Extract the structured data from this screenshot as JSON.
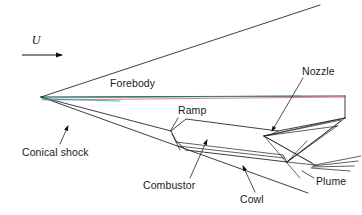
{
  "figure": {
    "type": "technical-line-diagram",
    "background_color": "#ffffff",
    "width": 362,
    "height": 215
  },
  "labels": {
    "freestream_velocity": "U",
    "forebody": "Forebody",
    "conical_shock": "Conical shock",
    "ramp": "Ramp",
    "combustor": "Combustor",
    "cowl": "Cowl",
    "nozzle": "Nozzle",
    "plume": "Plume"
  },
  "label_positions": {
    "freestream_velocity": {
      "x": 35,
      "y": 42
    },
    "forebody": {
      "x": 110,
      "y": 87
    },
    "conical_shock": {
      "x": 22,
      "y": 152
    },
    "ramp": {
      "x": 176,
      "y": 113
    },
    "combustor": {
      "x": 143,
      "y": 186
    },
    "cowl": {
      "x": 240,
      "y": 199
    },
    "nozzle": {
      "x": 302,
      "y": 71
    },
    "plume": {
      "x": 318,
      "y": 181
    }
  },
  "colors": {
    "line_ink": "#1c1c24",
    "leader_ink": "#15151c",
    "teal_streamline": "#1f9e92",
    "red_streamline": "#e8607a",
    "text": "#1a1a20",
    "background": "#ffffff"
  },
  "geometry": {
    "apex": {
      "x": 41,
      "y": 97
    },
    "body_tail_top": {
      "x": 345,
      "y": 96
    },
    "body_tail_bottom": {
      "x": 345,
      "y": 118
    },
    "upper_shock_end": {
      "x": 320,
      "y": 5
    },
    "lower_shock_end": {
      "x": 308,
      "y": 193
    },
    "plume_origin": {
      "x": 315,
      "y": 165
    },
    "nozzle_corner": {
      "x": 275,
      "y": 133
    },
    "ramp_junction": {
      "x": 171,
      "y": 131
    },
    "cowl_leading_edge": {
      "x": 186,
      "y": 150
    }
  },
  "annotations": {
    "velocity_arrow": {
      "from": {
        "x": 22,
        "y": 55
      },
      "to": {
        "x": 66,
        "y": 55
      },
      "direction": "right"
    },
    "leaders": [
      {
        "name": "conical-shock-leader",
        "target": "conical shock line"
      },
      {
        "name": "ramp-leader",
        "target": "ramp surface"
      },
      {
        "name": "combustor-leader",
        "target": "combustor duct"
      },
      {
        "name": "cowl-leader",
        "target": "cowl surface"
      },
      {
        "name": "nozzle-leader",
        "target": "nozzle expansion surface"
      },
      {
        "name": "plume-leader",
        "target": "plume shear layers"
      }
    ]
  }
}
